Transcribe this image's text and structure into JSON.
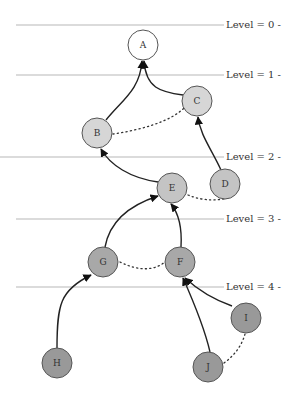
{
  "levels": [
    {
      "label": "Level = 0 -",
      "y": 25
    },
    {
      "label": "Level = 1 -",
      "y": 75
    },
    {
      "label": "Level = 2 -",
      "y": 157
    },
    {
      "label": "Level = 3 -",
      "y": 219
    },
    {
      "label": "Level = 4 -",
      "y": 287
    }
  ],
  "nodes": [
    {
      "id": "A",
      "label": "A",
      "x": 143,
      "y": 45,
      "color": "#ffffff"
    },
    {
      "id": "C",
      "label": "C",
      "x": 197,
      "y": 101,
      "color": "#d6d6d6"
    },
    {
      "id": "B",
      "label": "B",
      "x": 97,
      "y": 133,
      "color": "#d6d6d6"
    },
    {
      "id": "E",
      "label": "E",
      "x": 172,
      "y": 188,
      "color": "#c4c4c4"
    },
    {
      "id": "D",
      "label": "D",
      "x": 225,
      "y": 184,
      "color": "#c4c4c4"
    },
    {
      "id": "G",
      "label": "G",
      "x": 103,
      "y": 262,
      "color": "#a8a8a8"
    },
    {
      "id": "F",
      "label": "F",
      "x": 180,
      "y": 262,
      "color": "#a8a8a8"
    },
    {
      "id": "I",
      "label": "I",
      "x": 246,
      "y": 318,
      "color": "#999999"
    },
    {
      "id": "H",
      "label": "H",
      "x": 57,
      "y": 363,
      "color": "#999999"
    },
    {
      "id": "J",
      "label": "J",
      "x": 208,
      "y": 367,
      "color": "#999999"
    }
  ],
  "edges": [
    {
      "from": "B",
      "to": "A",
      "style": "solid"
    },
    {
      "from": "C",
      "to": "A",
      "style": "solid"
    },
    {
      "from": "D",
      "to": "C",
      "style": "solid"
    },
    {
      "from": "E",
      "to": "B",
      "style": "solid"
    },
    {
      "from": "G",
      "to": "E",
      "style": "solid"
    },
    {
      "from": "F",
      "to": "E",
      "style": "solid"
    },
    {
      "from": "H",
      "to": "G",
      "style": "solid"
    },
    {
      "from": "J",
      "to": "F",
      "style": "solid"
    },
    {
      "from": "I",
      "to": "F",
      "style": "solid"
    },
    {
      "from": "B",
      "to": "C",
      "style": "dotted"
    },
    {
      "from": "E",
      "to": "D",
      "style": "dotted"
    },
    {
      "from": "G",
      "to": "F",
      "style": "dotted"
    },
    {
      "from": "J",
      "to": "I",
      "style": "dotted"
    }
  ]
}
